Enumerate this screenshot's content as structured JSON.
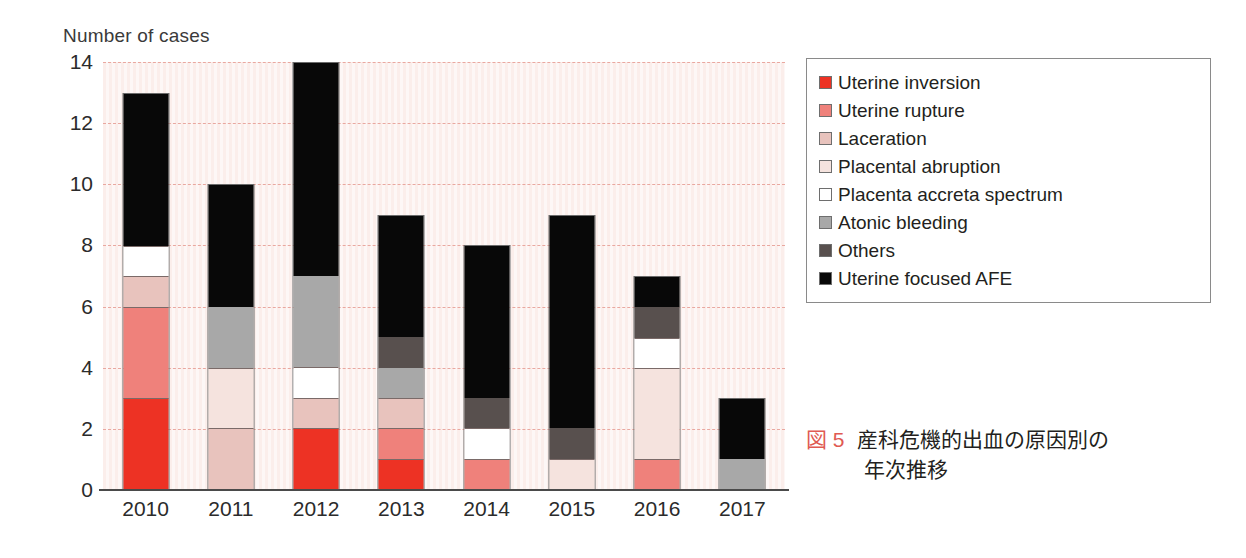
{
  "chart_data": {
    "type": "bar",
    "subtype": "stacked-vertical",
    "title": "",
    "xlabel": "",
    "ylabel": "Number of cases",
    "ylim": [
      0,
      14
    ],
    "yticks": [
      0,
      2,
      4,
      6,
      8,
      10,
      12,
      14
    ],
    "grid": true,
    "grid_style": "dashed",
    "legend_position": "right",
    "categories": [
      "2010",
      "2011",
      "2012",
      "2013",
      "2014",
      "2015",
      "2016",
      "2017"
    ],
    "series": [
      {
        "name": "Uterine inversion",
        "color": "#ED3224",
        "values": [
          3,
          0,
          2,
          1,
          0,
          0,
          0,
          0
        ]
      },
      {
        "name": "Uterine rupture",
        "color": "#EF817B",
        "values": [
          3,
          0,
          0,
          1,
          1,
          0,
          1,
          0
        ]
      },
      {
        "name": "Laceration",
        "color": "#E8C3BD",
        "values": [
          1,
          2,
          1,
          1,
          0,
          0,
          0,
          0
        ]
      },
      {
        "name": "Placental abruption",
        "color": "#F5E3DE",
        "values": [
          0,
          2,
          0,
          0,
          0,
          1,
          3,
          0
        ]
      },
      {
        "name": "Placenta accreta spectrum",
        "color": "#FFFFFF",
        "values": [
          1,
          0,
          1,
          0,
          1,
          0,
          1,
          0
        ]
      },
      {
        "name": "Atonic bleeding",
        "color": "#A8A8A8",
        "values": [
          0,
          2,
          3,
          1,
          0,
          0,
          0,
          1
        ]
      },
      {
        "name": "Others",
        "color": "#58504E",
        "values": [
          0,
          0,
          0,
          1,
          1,
          1,
          1,
          0
        ]
      },
      {
        "name": "Uterine focused AFE",
        "color": "#080808",
        "values": [
          5,
          4,
          7,
          4,
          5,
          7,
          1,
          2
        ]
      }
    ],
    "totals": [
      13,
      10,
      14,
      9,
      8,
      9,
      7,
      3
    ]
  },
  "legend": {
    "items": [
      {
        "label": "Uterine inversion",
        "color": "#ED3224"
      },
      {
        "label": "Uterine rupture",
        "color": "#EF817B"
      },
      {
        "label": "Laceration",
        "color": "#E8C3BD"
      },
      {
        "label": "Placental abruption",
        "color": "#F5E3DE"
      },
      {
        "label": "Placenta accreta spectrum",
        "color": "#FFFFFF"
      },
      {
        "label": "Atonic bleeding",
        "color": "#A8A8A8"
      },
      {
        "label": "Others",
        "color": "#58504E"
      },
      {
        "label": "Uterine focused AFE",
        "color": "#080808"
      }
    ]
  },
  "caption": {
    "figure_number": "図 5",
    "line1": "産科危機的出血の原因別の",
    "line2": "年次推移"
  },
  "colors": {
    "plot_background": "#FBEEEB",
    "gridline": "#E9A8A0",
    "axis": "#4A4A4A",
    "figure_number": "#E05A52",
    "text": "#231F20"
  }
}
